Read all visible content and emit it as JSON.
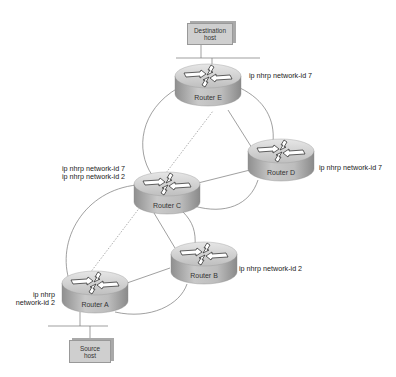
{
  "diagram": {
    "hosts": [
      {
        "id": "destination",
        "line1": "Destination",
        "line2": "host"
      },
      {
        "id": "source",
        "line1": "Source",
        "line2": "host"
      }
    ],
    "routers": [
      {
        "id": "E",
        "label": "Router E",
        "config": [
          "ip nhrp network-id 7"
        ]
      },
      {
        "id": "D",
        "label": "Router D",
        "config": [
          "ip nhrp network-id 7"
        ]
      },
      {
        "id": "C",
        "label": "Router C",
        "config": [
          "ip nhrp network-id 7",
          "ip nhrp network-id 2"
        ]
      },
      {
        "id": "B",
        "label": "Router B",
        "config": [
          "ip nhrp network-id 2"
        ]
      },
      {
        "id": "A",
        "label": "Router A",
        "config": [
          "ip nhrp",
          "network-id 2"
        ]
      }
    ],
    "links": [
      {
        "from": "E",
        "to": "C",
        "style": "curve"
      },
      {
        "from": "E",
        "to": "D",
        "style": "line"
      },
      {
        "from": "E",
        "to": "D",
        "style": "curve"
      },
      {
        "from": "C",
        "to": "D",
        "style": "line"
      },
      {
        "from": "C",
        "to": "D",
        "style": "curve"
      },
      {
        "from": "C",
        "to": "B",
        "style": "line"
      },
      {
        "from": "C",
        "to": "B",
        "style": "curve"
      },
      {
        "from": "C",
        "to": "A",
        "style": "curve"
      },
      {
        "from": "A",
        "to": "B",
        "style": "line"
      },
      {
        "from": "A",
        "to": "B",
        "style": "curve"
      },
      {
        "from": "A",
        "to": "E",
        "style": "dotted",
        "note": "shortcut path"
      }
    ],
    "colors": {
      "router_body": "#b8b8b8",
      "router_top": "#d8d8d8",
      "link": "#777777",
      "host_box": "#cfcfcf",
      "dotted": "#999999"
    }
  }
}
